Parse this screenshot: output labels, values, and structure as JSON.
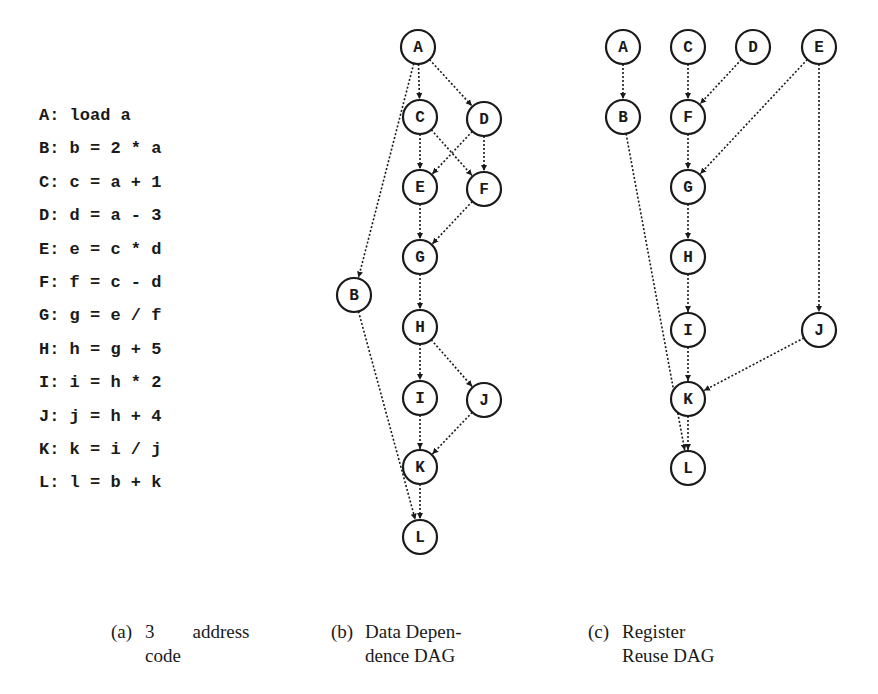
{
  "code_panel": {
    "lines": [
      "A: load a",
      "B: b = 2 * a",
      "C: c = a + 1",
      "D: d = a - 3",
      "E: e = c * d",
      "F: f = c - d",
      "G: g = e / f",
      "H: h = g + 5",
      "I: i = h * 2",
      "J: j = h + 4",
      "K: k = i / j",
      "L: l = b + k"
    ]
  },
  "data_dependence_dag": {
    "nodes": [
      {
        "id": "A",
        "x": 418,
        "y": 47
      },
      {
        "id": "C",
        "x": 420,
        "y": 117
      },
      {
        "id": "D",
        "x": 484,
        "y": 119
      },
      {
        "id": "E",
        "x": 420,
        "y": 187
      },
      {
        "id": "F",
        "x": 484,
        "y": 189
      },
      {
        "id": "G",
        "x": 420,
        "y": 257
      },
      {
        "id": "B",
        "x": 354,
        "y": 295
      },
      {
        "id": "H",
        "x": 420,
        "y": 327
      },
      {
        "id": "I",
        "x": 420,
        "y": 398
      },
      {
        "id": "J",
        "x": 484,
        "y": 400
      },
      {
        "id": "K",
        "x": 420,
        "y": 467
      },
      {
        "id": "L",
        "x": 420,
        "y": 537
      }
    ],
    "edges": [
      [
        "A",
        "C"
      ],
      [
        "A",
        "D"
      ],
      [
        "A",
        "B"
      ],
      [
        "C",
        "E"
      ],
      [
        "C",
        "F"
      ],
      [
        "D",
        "E"
      ],
      [
        "D",
        "F"
      ],
      [
        "E",
        "G"
      ],
      [
        "F",
        "G"
      ],
      [
        "G",
        "H"
      ],
      [
        "H",
        "I"
      ],
      [
        "H",
        "J"
      ],
      [
        "I",
        "K"
      ],
      [
        "J",
        "K"
      ],
      [
        "K",
        "L"
      ],
      [
        "B",
        "L"
      ]
    ]
  },
  "register_reuse_dag": {
    "nodes": [
      {
        "id": "A",
        "x": 623,
        "y": 47
      },
      {
        "id": "C",
        "x": 688,
        "y": 47
      },
      {
        "id": "D",
        "x": 753,
        "y": 47
      },
      {
        "id": "E",
        "x": 819,
        "y": 47
      },
      {
        "id": "B",
        "x": 623,
        "y": 117
      },
      {
        "id": "F",
        "x": 688,
        "y": 117
      },
      {
        "id": "G",
        "x": 688,
        "y": 187
      },
      {
        "id": "H",
        "x": 688,
        "y": 257
      },
      {
        "id": "I",
        "x": 688,
        "y": 330
      },
      {
        "id": "J",
        "x": 819,
        "y": 330
      },
      {
        "id": "K",
        "x": 688,
        "y": 399
      },
      {
        "id": "L",
        "x": 688,
        "y": 468
      }
    ],
    "edges": [
      [
        "A",
        "B"
      ],
      [
        "C",
        "F"
      ],
      [
        "D",
        "F"
      ],
      [
        "F",
        "G"
      ],
      [
        "E",
        "G"
      ],
      [
        "G",
        "H"
      ],
      [
        "H",
        "I"
      ],
      [
        "E",
        "J"
      ],
      [
        "I",
        "K"
      ],
      [
        "J",
        "K"
      ],
      [
        "K",
        "L"
      ],
      [
        "B",
        "L"
      ]
    ]
  },
  "captions": {
    "a": {
      "tag": "(a)",
      "line1": "3        address",
      "line2": "code"
    },
    "b": {
      "tag": "(b)",
      "line1": "Data Depen-",
      "line2": "dence DAG"
    },
    "c": {
      "tag": "(c)",
      "line1": "Register",
      "line2": "Reuse DAG"
    }
  }
}
